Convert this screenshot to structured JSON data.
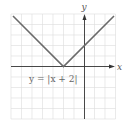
{
  "graph": {
    "equation_label": "y = |x + 2|",
    "x_axis_label": "x",
    "y_axis_label": "y",
    "x_range": [
      -7,
      3
    ],
    "y_range": [
      -5,
      5
    ],
    "vertex": [
      -2,
      0
    ],
    "colors": {
      "grid": "#d8d8d8",
      "axis": "#333333",
      "curve": "#666666"
    }
  }
}
